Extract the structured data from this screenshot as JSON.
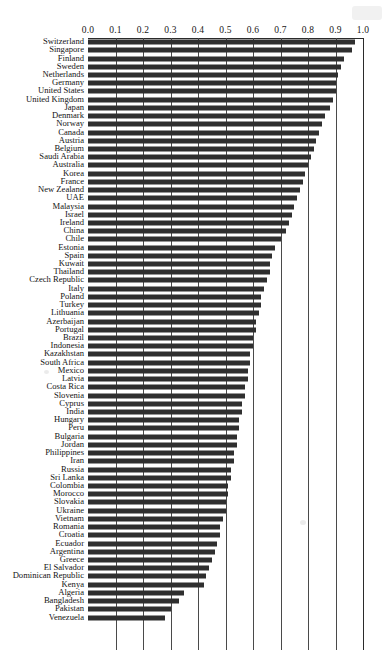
{
  "chart_data": {
    "type": "bar",
    "orientation": "horizontal",
    "title": "",
    "subtitle": "",
    "xlabel": "",
    "ylabel": "",
    "xlim": [
      0.0,
      1.0
    ],
    "xticks": [
      "0.0",
      "0.1",
      "0.2",
      "0.3",
      "0.4",
      "0.5",
      "0.6",
      "0.7",
      "0.8",
      "0.9",
      "1.0"
    ],
    "xtick_values": [
      0.0,
      0.1,
      0.2,
      0.3,
      0.4,
      0.5,
      0.6,
      0.7,
      0.8,
      0.9,
      1.0
    ],
    "grid": "vertical",
    "legend": "none",
    "bar_color": "#2f2f2f",
    "axis_position": "top",
    "categories": [
      "Switzerland",
      "Singapore",
      "Finland",
      "Sweden",
      "Netherlands",
      "Germany",
      "United States",
      "United Kingdom",
      "Japan",
      "Denmark",
      "Norway",
      "Canada",
      "Austria",
      "Belgium",
      "Saudi Arabia",
      "Australia",
      "Korea",
      "France",
      "New Zealand",
      "UAE",
      "Malaysia",
      "Israel",
      "Ireland",
      "China",
      "Chile",
      "Estonia",
      "Spain",
      "Kuwait",
      "Thailand",
      "Czech Republic",
      "Italy",
      "Poland",
      "Turkey",
      "Lithuania",
      "Azerbaijan",
      "Portugal",
      "Brazil",
      "Indonesia",
      "Kazakhstan",
      "South Africa",
      "Mexico",
      "Latvia",
      "Costa Rica",
      "Slovenia",
      "Cyprus",
      "India",
      "Hungary",
      "Peru",
      "Bulgaria",
      "Jordan",
      "Philippines",
      "Iran",
      "Russia",
      "Sri Lanka",
      "Colombia",
      "Morocco",
      "Slovakia",
      "Ukraine",
      "Vietnam",
      "Romania",
      "Croatia",
      "Ecuador",
      "Argentina",
      "Greece",
      "El Salvador",
      "Dominican Republic",
      "Kenya",
      "Algeria",
      "Bangladesh",
      "Pakistan",
      "Venezuela"
    ],
    "values": [
      0.97,
      0.96,
      0.93,
      0.92,
      0.91,
      0.9,
      0.9,
      0.89,
      0.88,
      0.86,
      0.85,
      0.84,
      0.83,
      0.82,
      0.81,
      0.8,
      0.79,
      0.78,
      0.77,
      0.76,
      0.75,
      0.74,
      0.73,
      0.72,
      0.7,
      0.68,
      0.67,
      0.66,
      0.66,
      0.65,
      0.64,
      0.63,
      0.63,
      0.62,
      0.61,
      0.61,
      0.6,
      0.6,
      0.59,
      0.59,
      0.58,
      0.58,
      0.57,
      0.57,
      0.56,
      0.56,
      0.55,
      0.55,
      0.54,
      0.54,
      0.53,
      0.53,
      0.52,
      0.52,
      0.51,
      0.51,
      0.5,
      0.5,
      0.49,
      0.48,
      0.48,
      0.47,
      0.46,
      0.45,
      0.44,
      0.43,
      0.42,
      0.35,
      0.33,
      0.3,
      0.28
    ]
  }
}
